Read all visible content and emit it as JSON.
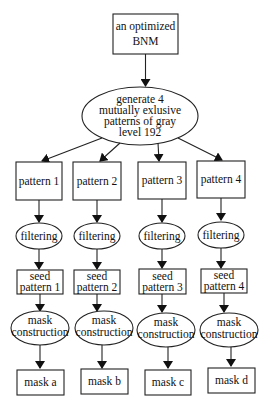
{
  "diagram": {
    "root": {
      "lines": [
        "an optimized",
        "BNM"
      ],
      "shape": "box"
    },
    "generator": {
      "lines": [
        "generate 4",
        "mutually exlusive",
        "patterns of gray",
        "level 192"
      ],
      "shape": "ellipse"
    },
    "columns": [
      {
        "pattern": "pattern 1",
        "filter": "filtering",
        "seed": [
          "seed",
          "pattern 1"
        ],
        "mask_construction": [
          "mask",
          "construction"
        ],
        "mask": "mask a"
      },
      {
        "pattern": "pattern 2",
        "filter": "filtering",
        "seed": [
          "seed",
          "pattern 2"
        ],
        "mask_construction": [
          "mask",
          "construction"
        ],
        "mask": "mask b"
      },
      {
        "pattern": "pattern 3",
        "filter": "filtering",
        "seed": [
          "seed",
          "pattern 3"
        ],
        "mask_construction": [
          "mask",
          "construction"
        ],
        "mask": "mask c"
      },
      {
        "pattern": "pattern 4",
        "filter": "filtering",
        "seed": [
          "seed",
          "pattern 4"
        ],
        "mask_construction": [
          "mask",
          "construction"
        ],
        "mask": "mask d"
      }
    ]
  }
}
